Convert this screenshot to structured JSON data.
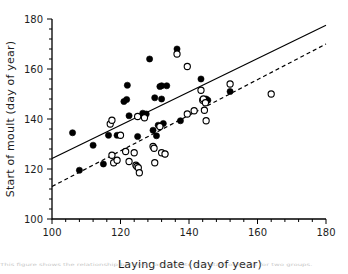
{
  "figure": {
    "caption_fragment": "This figure shows the relationship between laying date and start of moult for two groups."
  },
  "chart_data": {
    "type": "scatter",
    "title": "",
    "xlabel": "Laying date (day of year)",
    "ylabel": "Start of moult (day of year)",
    "xlim": [
      100,
      180
    ],
    "ylim": [
      100,
      180
    ],
    "xticks": [
      100,
      120,
      140,
      160,
      180
    ],
    "yticks": [
      100,
      120,
      140,
      160,
      180
    ],
    "xtick_labels": [
      "100",
      "120",
      "140",
      "160",
      "180"
    ],
    "ytick_labels": [
      "100",
      "120",
      "140",
      "160",
      "180"
    ],
    "minor_tick_step": 4,
    "grid": false,
    "legend": "none",
    "series": [
      {
        "name": "filled-circles",
        "marker": "filled-circle",
        "color": "#000000",
        "points": [
          [
            106.0,
            134.5
          ],
          [
            108.0,
            119.5
          ],
          [
            112.0,
            129.5
          ],
          [
            115.0,
            122.0
          ],
          [
            116.5,
            133.5
          ],
          [
            119.0,
            133.5
          ],
          [
            121.0,
            147.0
          ],
          [
            121.8,
            147.8
          ],
          [
            122.0,
            153.5
          ],
          [
            122.5,
            141.3
          ],
          [
            125.0,
            133.0
          ],
          [
            126.5,
            142.3
          ],
          [
            127.5,
            142.0
          ],
          [
            128.5,
            164.0
          ],
          [
            129.5,
            135.5
          ],
          [
            130.0,
            148.5
          ],
          [
            130.5,
            133.3
          ],
          [
            131.0,
            137.5
          ],
          [
            131.5,
            153.0
          ],
          [
            132.0,
            153.3
          ],
          [
            132.0,
            148.0
          ],
          [
            132.5,
            138.2
          ],
          [
            133.0,
            126.0
          ],
          [
            133.5,
            153.3
          ],
          [
            136.5,
            168.0
          ],
          [
            137.5,
            139.3
          ],
          [
            143.5,
            156.0
          ],
          [
            145.0,
            148.0
          ],
          [
            145.5,
            147.5
          ],
          [
            152.0,
            151.0
          ]
        ]
      },
      {
        "name": "open-circles",
        "marker": "open-circle",
        "color": "#000000",
        "points": [
          [
            117.0,
            138.0
          ],
          [
            117.5,
            139.5
          ],
          [
            117.5,
            125.5
          ],
          [
            118.0,
            122.5
          ],
          [
            119.0,
            123.5
          ],
          [
            120.0,
            133.5
          ],
          [
            121.5,
            127.0
          ],
          [
            122.5,
            123.0
          ],
          [
            124.0,
            126.5
          ],
          [
            124.5,
            121.5
          ],
          [
            124.8,
            121.0
          ],
          [
            125.0,
            141.0
          ],
          [
            125.2,
            120.5
          ],
          [
            125.5,
            118.5
          ],
          [
            127.0,
            140.5
          ],
          [
            129.5,
            129.0
          ],
          [
            129.8,
            128.3
          ],
          [
            130.0,
            122.5
          ],
          [
            131.5,
            137.0
          ],
          [
            132.0,
            126.5
          ],
          [
            133.0,
            126.0
          ],
          [
            136.5,
            166.0
          ],
          [
            139.5,
            161.0
          ],
          [
            139.5,
            142.0
          ],
          [
            141.5,
            143.3
          ],
          [
            143.5,
            151.5
          ],
          [
            144.0,
            147.5
          ],
          [
            144.2,
            148.0
          ],
          [
            144.5,
            143.5
          ],
          [
            144.8,
            146.5
          ],
          [
            145.0,
            139.3
          ],
          [
            152.0,
            154.0
          ],
          [
            164.0,
            150.0
          ]
        ]
      }
    ],
    "fit_lines": [
      {
        "name": "solid-regression-line",
        "style": "solid",
        "color": "#000000",
        "x0": 100,
        "y0": 124.2,
        "x1": 180,
        "y1": 177.5
      },
      {
        "name": "dashed-regression-line",
        "style": "dashed",
        "color": "#000000",
        "x0": 100,
        "y0": 113.0,
        "x1": 180,
        "y1": 170.0
      }
    ]
  }
}
